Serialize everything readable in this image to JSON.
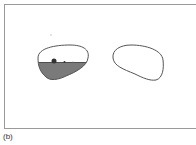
{
  "figure": {
    "caption": "(b)",
    "colors": {
      "frame": "#9a9a9a",
      "outline": "#555555",
      "fill": "#7a7a7a",
      "background": "#ffffff"
    },
    "left_lens": {
      "label": "",
      "filled_lower_portion": true
    },
    "right_lens": {
      "label": "",
      "filled_lower_portion": false
    }
  }
}
